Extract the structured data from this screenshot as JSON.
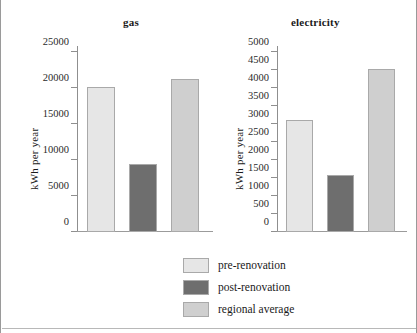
{
  "chart_data": [
    {
      "type": "bar",
      "title": "gas",
      "xlabel": "",
      "ylabel": "kWh per year",
      "ylim": [
        0,
        25000
      ],
      "ytick_step": 5000,
      "yticks": [
        "0",
        "5000",
        "10000",
        "15000",
        "20000",
        "25000"
      ],
      "grid": false,
      "categories": [
        "pre-renovation",
        "post-renovation",
        "regional average"
      ],
      "values": [
        20100,
        9400,
        21200
      ]
    },
    {
      "type": "bar",
      "title": "electricity",
      "xlabel": "",
      "ylabel": "kWh per year",
      "ylim": [
        0,
        5000
      ],
      "ytick_step": 500,
      "yticks": [
        "0",
        "500",
        "1000",
        "1500",
        "2000",
        "2500",
        "3000",
        "3500",
        "4000",
        "4500",
        "5000"
      ],
      "grid": false,
      "categories": [
        "pre-renovation",
        "post-renovation",
        "regional average"
      ],
      "values": [
        3120,
        1580,
        4530
      ]
    }
  ],
  "legend": {
    "position": "bottom-center",
    "entries": [
      {
        "label": "pre-renovation",
        "color": "#e6e6e6"
      },
      {
        "label": "post-renovation",
        "color": "#6e6e6e"
      },
      {
        "label": "regional average",
        "color": "#cfcfcf"
      }
    ]
  }
}
